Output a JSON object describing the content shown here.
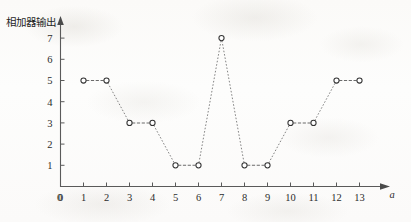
{
  "figure": {
    "y_axis_title": "相加器输出",
    "x_axis_title": "a"
  },
  "chart_data": {
    "type": "line",
    "title": "",
    "subtitle": "",
    "xlabel": "a",
    "ylabel": "相加器输出",
    "x": [
      1,
      2,
      3,
      4,
      5,
      6,
      7,
      8,
      9,
      10,
      11,
      12,
      13
    ],
    "values": [
      5,
      5,
      3,
      3,
      1,
      1,
      7,
      1,
      1,
      3,
      3,
      5,
      5
    ],
    "series": [
      {
        "name": "相加器输出",
        "values": [
          5,
          5,
          3,
          3,
          1,
          1,
          7,
          1,
          1,
          3,
          3,
          5,
          5
        ]
      }
    ],
    "points": [
      {
        "x": 1,
        "y": 5
      },
      {
        "x": 2,
        "y": 5
      },
      {
        "x": 3,
        "y": 3
      },
      {
        "x": 4,
        "y": 3
      },
      {
        "x": 5,
        "y": 1
      },
      {
        "x": 6,
        "y": 1
      },
      {
        "x": 7,
        "y": 7
      },
      {
        "x": 8,
        "y": 1
      },
      {
        "x": 9,
        "y": 1
      },
      {
        "x": 10,
        "y": 3
      },
      {
        "x": 11,
        "y": 3
      },
      {
        "x": 12,
        "y": 5
      },
      {
        "x": 13,
        "y": 5
      }
    ],
    "xticks": [
      0,
      1,
      2,
      3,
      4,
      5,
      6,
      7,
      8,
      9,
      10,
      11,
      12,
      13
    ],
    "xtick_labels": [
      "0",
      "1",
      "2",
      "3",
      "4",
      "5",
      "6",
      "7",
      "8",
      "9",
      "10",
      "11",
      "12",
      "13"
    ],
    "yticks": [
      1,
      2,
      3,
      4,
      5,
      6,
      7
    ],
    "ytick_labels": [
      "1",
      "2",
      "3",
      "4",
      "5",
      "6",
      "7"
    ],
    "xlim": [
      0,
      13
    ],
    "ylim": [
      0,
      7.6
    ],
    "grid": false,
    "legend": false,
    "legend_position": "none",
    "marker": "open-circle",
    "linestyle": "dashed",
    "line_color": "#6e6e6e",
    "marker_edge_color": "#333333",
    "marker_face_color": "#ffffff",
    "axis_color": "#5a5a5a",
    "text_color": "#2c2c2c",
    "background_color": "#fdfdfc",
    "x_axis_has_arrow": true,
    "y_axis_has_arrow": true
  }
}
